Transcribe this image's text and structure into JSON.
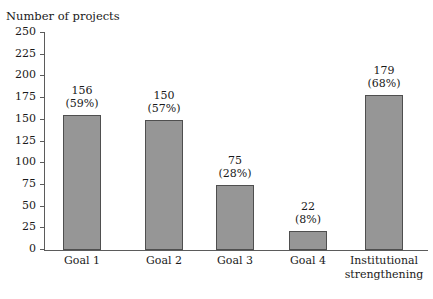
{
  "chart_data": {
    "type": "bar",
    "title": "",
    "xlabel": "",
    "ylabel": "Number of projects",
    "ylim": [
      0,
      250
    ],
    "ytick_step": 25,
    "grid": false,
    "legend": null,
    "categories": [
      "Goal 1",
      "Goal 2",
      "Goal 3",
      "Goal 4",
      "Institutional strengthening"
    ],
    "values": [
      156,
      150,
      75,
      22,
      179
    ],
    "percent_labels": [
      "(59%)",
      "(57%)",
      "(28%)",
      "(8%)",
      "(68%)"
    ],
    "percents": [
      59,
      57,
      28,
      8,
      68
    ],
    "ytick_labels": [
      "0",
      "25",
      "50",
      "75",
      "100",
      "125",
      "150",
      "175",
      "200",
      "225",
      "250"
    ],
    "bar_color": "#969696",
    "bar_border_color": "#4f4f4f",
    "axis_color": "#5b5b5b",
    "text_color": "#1a1a1a",
    "bars": [
      {
        "label_lines": [
          "Goal 1"
        ],
        "value": 156,
        "value_text": "156",
        "percent_text": "(59%)"
      },
      {
        "label_lines": [
          "Goal 2"
        ],
        "value": 150,
        "value_text": "150",
        "percent_text": "(57%)"
      },
      {
        "label_lines": [
          "Goal 3"
        ],
        "value": 75,
        "value_text": "75",
        "percent_text": "(28%)"
      },
      {
        "label_lines": [
          "Goal 4"
        ],
        "value": 22,
        "value_text": "22",
        "percent_text": "(8%)"
      },
      {
        "label_lines": [
          "Institutional",
          "strengthening"
        ],
        "value": 179,
        "value_text": "179",
        "percent_text": "(68%)"
      }
    ]
  }
}
